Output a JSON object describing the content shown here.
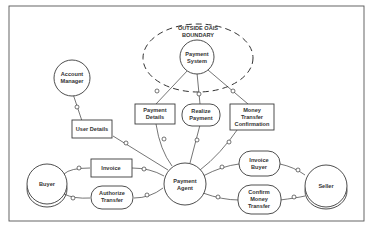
{
  "diagram": {
    "type": "actor-message diagram",
    "boundary": {
      "label_line1": "OUTSIDE OAIS",
      "label_line2": "BOUNDARY"
    },
    "actors": [
      {
        "id": "payment-system",
        "line1": "Payment",
        "line2": "System",
        "shape": "circle"
      },
      {
        "id": "account-manager",
        "line1": "Account",
        "line2": "Manager",
        "shape": "circle"
      },
      {
        "id": "buyer",
        "line1": "Buyer",
        "line2": "",
        "shape": "multi-circle"
      },
      {
        "id": "payment-agent",
        "line1": "Payment",
        "line2": "Agent",
        "shape": "circle"
      },
      {
        "id": "seller",
        "line1": "Seller",
        "line2": "",
        "shape": "multi-circle"
      }
    ],
    "messages": [
      {
        "id": "payment-details",
        "line1": "Payment",
        "line2": "Details",
        "line3": "",
        "shape": "rectangle"
      },
      {
        "id": "realize-payment",
        "line1": "Realize",
        "line2": "Payment",
        "line3": "",
        "shape": "rounded"
      },
      {
        "id": "money-transfer-confirmation",
        "line1": "Money",
        "line2": "Transfer",
        "line3": "Confirmation",
        "shape": "rectangle"
      },
      {
        "id": "user-details",
        "line1": "User Details",
        "line2": "",
        "line3": "",
        "shape": "rectangle"
      },
      {
        "id": "invoice",
        "line1": "Invoice",
        "line2": "",
        "line3": "",
        "shape": "rectangle"
      },
      {
        "id": "authorize-transfer",
        "line1": "Authorize",
        "line2": "Transfer",
        "line3": "",
        "shape": "rounded"
      },
      {
        "id": "invoice-buyer",
        "line1": "Invoice",
        "line2": "Buyer",
        "line3": "",
        "shape": "rounded"
      },
      {
        "id": "confirm-money-transfer",
        "line1": "Confirm",
        "line2": "Money",
        "line3": "Transfer",
        "shape": "rounded"
      }
    ]
  }
}
